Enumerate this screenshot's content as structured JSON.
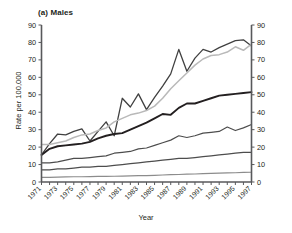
{
  "chart_data": {
    "type": "line",
    "title": "(a) Males",
    "xlabel": "Year",
    "ylabel": "Rate per 100,000",
    "ylim": [
      0,
      90
    ],
    "ytick_step": 10,
    "yticks": [
      0,
      10,
      20,
      30,
      40,
      50,
      60,
      70,
      80,
      90
    ],
    "right_axis": true,
    "right_yticks": [
      0,
      10,
      20,
      30,
      40,
      50,
      60,
      70,
      80,
      90
    ],
    "grid": false,
    "legend": "none",
    "xlim": [
      1971,
      1997
    ],
    "x": [
      1971,
      1972,
      1973,
      1974,
      1975,
      1976,
      1977,
      1978,
      1979,
      1980,
      1981,
      1982,
      1983,
      1984,
      1985,
      1986,
      1987,
      1988,
      1989,
      1990,
      1991,
      1992,
      1993,
      1994,
      1995,
      1996,
      1997
    ],
    "xticks": [
      1971,
      1972,
      1973,
      1974,
      1975,
      1976,
      1977,
      1978,
      1979,
      1980,
      1981,
      1982,
      1983,
      1984,
      1985,
      1986,
      1987,
      1988,
      1989,
      1990,
      1991,
      1992,
      1993,
      1994,
      1995,
      1996,
      1997
    ],
    "xtick_labels": [
      "1971",
      "",
      "1973",
      "",
      "1975",
      "",
      "1977",
      "",
      "1979",
      "",
      "1981",
      "",
      "1983",
      "",
      "1985",
      "",
      "1987",
      "",
      "1989",
      "",
      "1991",
      "",
      "1993",
      "",
      "1995",
      "",
      "1997"
    ],
    "series": [
      {
        "name": "oldest-age-group-jagged",
        "color": "#404040",
        "width": 1.3,
        "values": [
          15.5,
          22.0,
          27.5,
          27.0,
          29.0,
          30.5,
          23.5,
          29.0,
          34.5,
          26.5,
          48.0,
          43.0,
          50.5,
          41.5,
          48.5,
          55.0,
          62.0,
          76.0,
          63.5,
          71.0,
          76.0,
          74.5,
          77.0,
          79.0,
          81.0,
          81.5,
          78.0
        ]
      },
      {
        "name": "second-oldest-age-group-smooth",
        "color": "#b9b9b9",
        "width": 1.5,
        "values": [
          21.5,
          21.5,
          22.5,
          23.5,
          25.5,
          27.0,
          27.5,
          29.5,
          31.0,
          34.5,
          36.5,
          38.5,
          39.5,
          41.0,
          43.5,
          48.0,
          53.5,
          58.0,
          62.5,
          67.0,
          70.5,
          72.5,
          73.0,
          74.5,
          77.5,
          75.5,
          79.0
        ]
      },
      {
        "name": "middle-age-group-bold",
        "color": "#231f20",
        "width": 1.9,
        "values": [
          15.5,
          19.0,
          20.5,
          21.0,
          21.5,
          22.0,
          23.0,
          25.0,
          26.5,
          27.5,
          28.0,
          30.0,
          32.0,
          34.0,
          36.5,
          39.0,
          38.5,
          42.5,
          45.0,
          45.0,
          46.5,
          48.0,
          49.5,
          50.0,
          50.5,
          51.0,
          51.5
        ]
      },
      {
        "name": "mid-lower-age-group",
        "color": "#4d4d4d",
        "width": 1.2,
        "values": [
          11.0,
          11.0,
          11.5,
          12.5,
          13.5,
          13.5,
          14.0,
          14.5,
          15.0,
          16.5,
          17.0,
          17.5,
          19.0,
          19.5,
          21.0,
          22.5,
          24.0,
          26.5,
          25.5,
          26.5,
          28.0,
          28.5,
          29.0,
          31.5,
          29.5,
          31.0,
          33.0
        ]
      },
      {
        "name": "lower-age-group",
        "color": "#4d4d4d",
        "width": 1.2,
        "values": [
          7.0,
          7.0,
          7.5,
          7.5,
          8.0,
          8.5,
          8.5,
          9.0,
          9.0,
          9.5,
          10.0,
          10.5,
          11.0,
          11.5,
          12.0,
          12.5,
          13.0,
          13.5,
          13.5,
          14.0,
          14.5,
          15.0,
          15.5,
          16.0,
          16.5,
          17.0,
          17.0
        ]
      },
      {
        "name": "youngest-age-group",
        "color": "#8c8c8c",
        "width": 1.2,
        "values": [
          2.7,
          2.7,
          2.8,
          2.9,
          3.0,
          3.0,
          3.1,
          3.2,
          3.2,
          3.3,
          3.4,
          3.5,
          3.6,
          3.7,
          3.8,
          4.0,
          4.2,
          4.3,
          4.5,
          4.6,
          4.8,
          5.0,
          5.1,
          5.2,
          5.3,
          5.5,
          5.6
        ]
      }
    ]
  },
  "axes": {
    "left_axis_name": "left-value-axis",
    "right_axis_name": "right-value-axis",
    "x_axis_name": "year-axis"
  }
}
